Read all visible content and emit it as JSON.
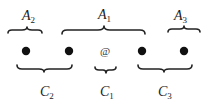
{
  "diagram": {
    "top_labels": [
      {
        "id": "A2",
        "main": "A",
        "sub": "2"
      },
      {
        "id": "A1",
        "main": "A",
        "sub": "1"
      },
      {
        "id": "A3",
        "main": "A",
        "sub": "3"
      }
    ],
    "bottom_labels": [
      {
        "id": "C2",
        "main": "C",
        "sub": "2"
      },
      {
        "id": "C1",
        "main": "C",
        "sub": "1"
      },
      {
        "id": "C3",
        "main": "C",
        "sub": "3"
      }
    ],
    "center_symbol": "@",
    "dot_count": 4,
    "colors": {
      "ink": "#222222",
      "dot": "#111111",
      "background": "#ffffff"
    }
  }
}
